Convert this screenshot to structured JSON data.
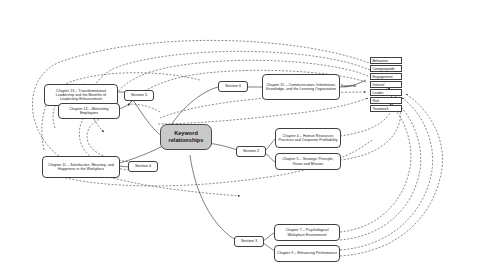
{
  "diagram": {
    "title": "Keyword relationships",
    "type": "mind-map",
    "center": {
      "label": "Keyword\nrelationships",
      "line1": "Keyword",
      "line2": "relationships"
    },
    "sections": [
      {
        "id": "section-2",
        "label": "Section 2"
      },
      {
        "id": "section-3",
        "label": "Section 3"
      },
      {
        "id": "section-4",
        "label": "Section 4"
      },
      {
        "id": "section-5",
        "label": "Section 5"
      },
      {
        "id": "section-6",
        "label": "Section 6"
      }
    ],
    "chapters": [
      {
        "id": "chapter-13",
        "label": "Chapter 13 – Transformational Leadership and the Benefits of Leadership Enhancement",
        "section": "Section 5"
      },
      {
        "id": "chapter-14",
        "label": "Chapter 14 – Motivating Employees",
        "section": "Section 5"
      },
      {
        "id": "chapter-11",
        "label": "Chapter 11 – Satisfaction, Meaning, and Happiness in the Workplace",
        "section": "Section 4"
      },
      {
        "id": "chapter-15",
        "label": "Chapter 15 – Communication, Information, Knowledge, and the Learning Organization",
        "section": "Section 6"
      },
      {
        "id": "chapter-4",
        "label": "Chapter 4 – Human Resources Practices and Corporate Profitability",
        "section": "Section 2"
      },
      {
        "id": "chapter-5",
        "label": "Chapter 5 – Strategic Principle, Vision and Mission",
        "section": "Section 2"
      },
      {
        "id": "chapter-7",
        "label": "Chapter 7 – Psychological Workplace Environment",
        "section": "Section 3"
      },
      {
        "id": "chapter-9",
        "label": "Chapter 9 – Enhancing Performance",
        "section": "Section 3"
      }
    ],
    "keywords_label": "Keywords",
    "keywords": [
      {
        "id": "keyword-behaviour",
        "label": "Behaviour"
      },
      {
        "id": "keyword-companywide",
        "label": "Companywide"
      },
      {
        "id": "keyword-engagement",
        "label": "Engagement"
      },
      {
        "id": "keyword-internal",
        "label": "Internal"
      },
      {
        "id": "keyword-leader",
        "label": "Leader"
      },
      {
        "id": "keyword-risk",
        "label": "Risk"
      },
      {
        "id": "keyword-teamwork",
        "label": "Teamwork"
      }
    ],
    "colors": {
      "center_fill": "#c9c9c9",
      "node_fill": "#ffffff",
      "stroke": "#3f3f3f",
      "text": "#1a1a1a",
      "background": "#ffffff"
    }
  }
}
